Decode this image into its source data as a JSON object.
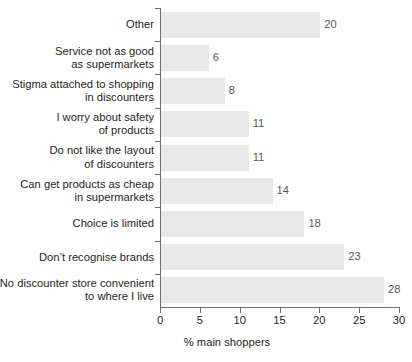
{
  "chart_data": {
    "type": "bar",
    "orientation": "horizontal",
    "title": "",
    "xlabel": "% main shoppers",
    "ylabel": "",
    "xlim": [
      0,
      30
    ],
    "xticks": [
      0,
      5,
      10,
      15,
      20,
      25,
      30
    ],
    "xtick_labels": [
      "0",
      "5",
      "10",
      "15",
      "20",
      "25",
      "30"
    ],
    "grid": false,
    "legend": null,
    "categories": [
      "Other",
      "Service not as good\nas supermarkets",
      "Stigma attached to shopping\nin discounters",
      "I worry about safety\nof products",
      "Do not like the layout\nof discounters",
      "Can get products as cheap\nin supermarkets",
      "Choice is limited",
      "Don’t recognise brands",
      "No discounter store convenient\nto where I live"
    ],
    "values": [
      20,
      6,
      8,
      11,
      11,
      14,
      18,
      23,
      28
    ],
    "value_labels": [
      "20",
      "6",
      "8",
      "11",
      "11",
      "14",
      "18",
      "23",
      "28"
    ],
    "bar_color": "#e8e8e8",
    "axis_color": "#6d6e71",
    "text_color": "#231f20",
    "value_label_color": "#58595b"
  }
}
